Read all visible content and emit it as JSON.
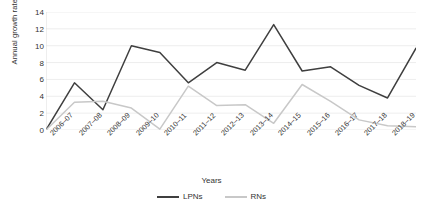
{
  "chart_data": {
    "type": "line",
    "title": "",
    "xlabel": "Years",
    "ylabel": "Annual growth rate (%)",
    "ylim": [
      0,
      14
    ],
    "yticks": [
      0,
      2,
      4,
      6,
      8,
      10,
      12,
      14
    ],
    "grid": true,
    "legend_position": "bottom",
    "categories": [
      "2006–07",
      "2007–08",
      "2008–09",
      "2009–10",
      "2010–11",
      "2011–12",
      "2012–13",
      "2013–14",
      "2014–15",
      "2015–16",
      "2016–17",
      "2017–18",
      "2018–19"
    ],
    "origin_point": 0,
    "series": [
      {
        "name": "LPNs",
        "color": "#3f3f3f",
        "values": [
          5.6,
          2.4,
          10.0,
          9.2,
          5.6,
          8.0,
          7.1,
          12.5,
          7.0,
          7.5,
          5.3,
          3.8,
          9.7
        ]
      },
      {
        "name": "RNs",
        "color": "#c8c8c8",
        "values": [
          3.3,
          3.4,
          2.6,
          0.1,
          5.2,
          2.9,
          3.0,
          0.8,
          5.4,
          3.4,
          1.2,
          0.5,
          0.4
        ]
      }
    ]
  },
  "legend": {
    "items": [
      {
        "label": "LPNs",
        "color": "#3f3f3f"
      },
      {
        "label": "RNs",
        "color": "#c8c8c8"
      }
    ]
  },
  "colors": {
    "gridline": "#e8e8e8",
    "axis": "#d9d9d9",
    "text": "#333333",
    "background": "#ffffff"
  }
}
